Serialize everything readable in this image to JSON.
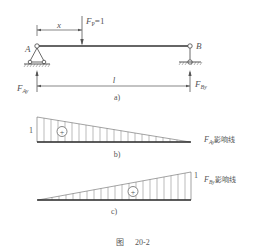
{
  "figure": {
    "caption_prefix": "图",
    "caption_number": "20-2",
    "line_color": "#444444",
    "text_color": "#555555"
  },
  "panel_a": {
    "label": "a)",
    "load_label": "F",
    "load_sub": "P",
    "load_value": "=1",
    "dim_x_label": "x",
    "dim_l_label": "l",
    "support_a_label": "A",
    "support_b_label": "B",
    "reaction_a_label": "F",
    "reaction_a_sub": "Ay",
    "reaction_b_label": "F",
    "reaction_b_sub": "By"
  },
  "panel_b": {
    "label": "b)",
    "ordinate_value": "1",
    "sign": "+",
    "title_var": "F",
    "title_sub": "Ay",
    "title_text": "影响线"
  },
  "panel_c": {
    "label": "c)",
    "ordinate_value": "1",
    "sign": "+",
    "title_var": "F",
    "title_sub": "By",
    "title_text": "影响线"
  }
}
